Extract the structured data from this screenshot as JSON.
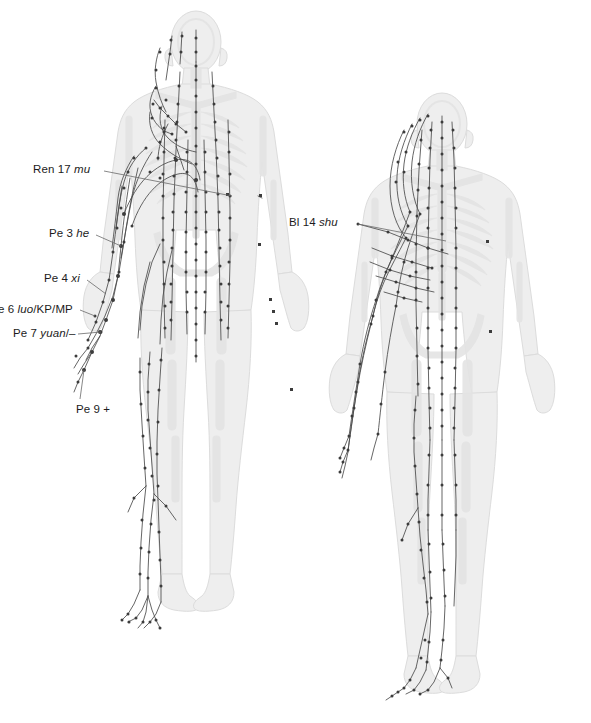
{
  "figure": {
    "type": "anatomical-meridian-chart",
    "views": [
      {
        "id": "anterior",
        "name": "anterior-body-view"
      },
      {
        "id": "posterior",
        "name": "posterior-body-view"
      }
    ],
    "colors": {
      "body_fill": "#eeeeee",
      "body_stroke": "#dcdcdc",
      "skeleton": "#e4e4e4",
      "meridian_line": "#4a4a4a",
      "point_dot": "#3c3c3c",
      "leader_line": "#6a6a6a",
      "text": "#1c1c1c",
      "background": "#ffffff"
    }
  },
  "labels": [
    {
      "id": "ren17",
      "name": "label-ren-17-mu",
      "prefix": "Ren 17 ",
      "italic": "mu",
      "suffix": "",
      "x": 33,
      "y": 163,
      "leader": {
        "x1": 104,
        "y1": 171,
        "x2": 232,
        "y2": 196
      }
    },
    {
      "id": "pe3",
      "name": "label-pe-3-he",
      "prefix": "Pe 3 ",
      "italic": "he",
      "suffix": "",
      "x": 49,
      "y": 227,
      "leader": {
        "x1": 96,
        "y1": 235,
        "x2": 121,
        "y2": 246
      }
    },
    {
      "id": "pe4",
      "name": "label-pe-4-xi",
      "prefix": "Pe 4 ",
      "italic": "xi",
      "suffix": "",
      "x": 44,
      "y": 272,
      "leader": {
        "x1": 87,
        "y1": 280,
        "x2": 106,
        "y2": 294
      }
    },
    {
      "id": "pe6",
      "name": "label-pe-6-luo-kp-mp",
      "prefix": "e 6 ",
      "italic": "luo",
      "suffix": "/KP/MP",
      "x": -2,
      "y": 303,
      "cropped_left": true,
      "leader": {
        "x1": 80,
        "y1": 310,
        "x2": 95,
        "y2": 316
      }
    },
    {
      "id": "pe7",
      "name": "label-pe-7-yuan",
      "prefix": "Pe 7 ",
      "italic": "yuan",
      "suffix": "/–",
      "x": 13,
      "y": 327,
      "leader": {
        "x1": 78,
        "y1": 334,
        "x2": 101,
        "y2": 332
      }
    },
    {
      "id": "pe9",
      "name": "label-pe-9-plus",
      "prefix": "Pe 9 +",
      "italic": "",
      "suffix": "",
      "x": 76,
      "y": 403,
      "leader": {
        "x1": 80,
        "y1": 399,
        "x2": 84,
        "y2": 370
      }
    },
    {
      "id": "bl14",
      "name": "label-bl-14-shu",
      "prefix": "Bl 14 ",
      "italic": "shu",
      "suffix": "",
      "x": 289,
      "y": 216,
      "leader": {
        "x1": 358,
        "y1": 224,
        "x2": 446,
        "y2": 241
      }
    }
  ],
  "cropped_header_fragments": [
    {
      "name": "cropped-text-fragment-left",
      "text": "",
      "x": 78,
      "y": -4
    },
    {
      "name": "cropped-text-fragment-right",
      "text": "",
      "x": 207,
      "y": -4
    }
  ]
}
